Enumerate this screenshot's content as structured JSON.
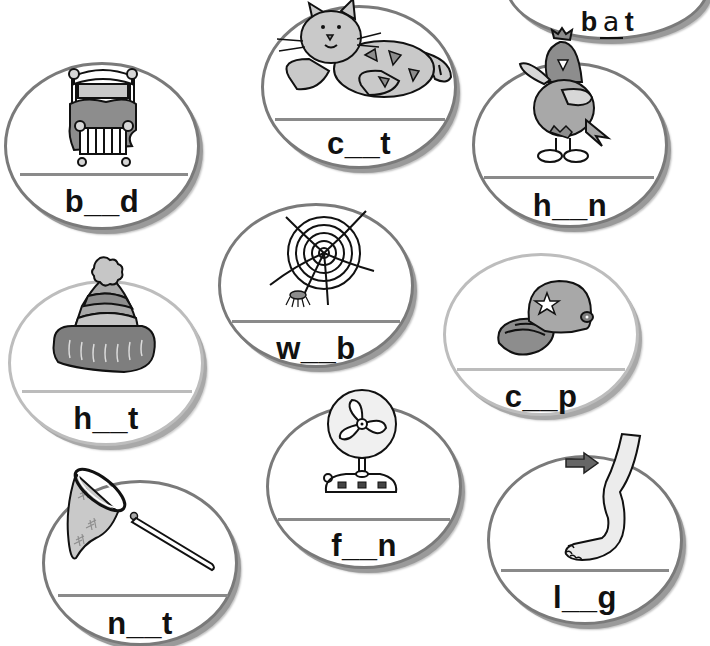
{
  "worksheet": {
    "example": {
      "word": "bat",
      "first": "b",
      "vowel": "a",
      "last": "t"
    },
    "cards": [
      {
        "id": "bed",
        "first": "b",
        "last": "d",
        "blank": "__",
        "picture": "bed"
      },
      {
        "id": "cat",
        "first": "c",
        "last": "t",
        "blank": "__",
        "picture": "cat"
      },
      {
        "id": "hen",
        "first": "h",
        "last": "n",
        "blank": "__",
        "picture": "hen"
      },
      {
        "id": "web",
        "first": "w",
        "last": "b",
        "blank": "__",
        "picture": "spider-web"
      },
      {
        "id": "hat",
        "first": "h",
        "last": "t",
        "blank": "__",
        "picture": "wool-hat"
      },
      {
        "id": "cap",
        "first": "c",
        "last": "p",
        "blank": "__",
        "picture": "baseball-cap"
      },
      {
        "id": "fan",
        "first": "f",
        "last": "n",
        "blank": "__",
        "picture": "electric-fan"
      },
      {
        "id": "net",
        "first": "n",
        "last": "t",
        "blank": "__",
        "picture": "butterfly-net"
      },
      {
        "id": "leg",
        "first": "l",
        "last": "g",
        "blank": "__",
        "picture": "leg"
      }
    ]
  },
  "colors": {
    "outline": "#7a7a7a",
    "shadow": "#9a9a9a",
    "fill_light": "#d0d0d0",
    "fill_mid": "#a8a8a8",
    "fill_dark": "#7e7e7e",
    "ink": "#111111"
  }
}
